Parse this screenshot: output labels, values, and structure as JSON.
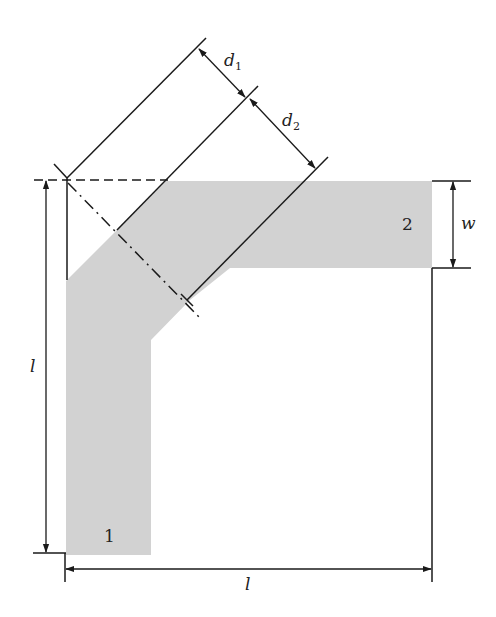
{
  "diagram": {
    "title": "",
    "type": "mitered-bend-geometry",
    "colors": {
      "strip": "#d2d2d2",
      "line": "#1a1a1a"
    },
    "labels": {
      "port1": "1",
      "port2": "2",
      "width": "w",
      "length_vertical": "l",
      "length_horizontal": "l",
      "d1_main": "d",
      "d1_sub": "1",
      "d2_main": "d",
      "d2_sub": "2"
    },
    "dimensions": [
      {
        "name": "d1",
        "description": "distance from outer corner to miter edge"
      },
      {
        "name": "d2",
        "description": "distance from miter edge to inner corner"
      },
      {
        "name": "w",
        "description": "strip width"
      },
      {
        "name": "l",
        "description": "arm length (vertical)"
      },
      {
        "name": "l",
        "description": "arm length (horizontal)"
      }
    ]
  }
}
